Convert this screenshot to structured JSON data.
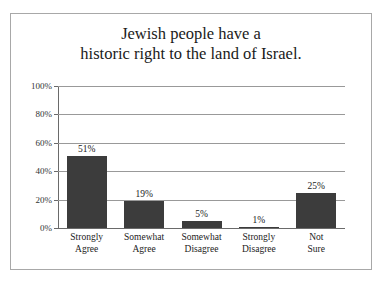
{
  "frame": {
    "border_color": "#a8a8a8",
    "background": "#ffffff"
  },
  "chart_data": {
    "type": "bar",
    "title": "Jewish people have a historic right to the land of Israel.",
    "title_lines": [
      "Jewish people have a",
      "historic right to the land of Israel."
    ],
    "categories": [
      "Strongly Agree",
      "Somewhat Agree",
      "Somewhat Disagree",
      "Strongly Disagree",
      "Not Sure"
    ],
    "category_lines": [
      [
        "Strongly",
        "Agree"
      ],
      [
        "Somewhat",
        "Agree"
      ],
      [
        "Somewhat",
        "Disagree"
      ],
      [
        "Strongly",
        "Disagree"
      ],
      [
        "Not",
        "Sure"
      ]
    ],
    "values": [
      51,
      19,
      5,
      1,
      25
    ],
    "value_labels": [
      "51%",
      "19%",
      "5%",
      "1%",
      "25%"
    ],
    "xlabel": "",
    "ylabel": "",
    "ylim": [
      0,
      100
    ],
    "ytick_values": [
      0,
      20,
      40,
      60,
      80,
      100
    ],
    "ytick_labels": [
      "0%",
      "20%",
      "40%",
      "60%",
      "80%",
      "100%"
    ],
    "grid": true,
    "legend": false,
    "bar_color": "#3c3c3c",
    "gridline_color": "#999999",
    "axis_color": "#6a6a6a"
  }
}
